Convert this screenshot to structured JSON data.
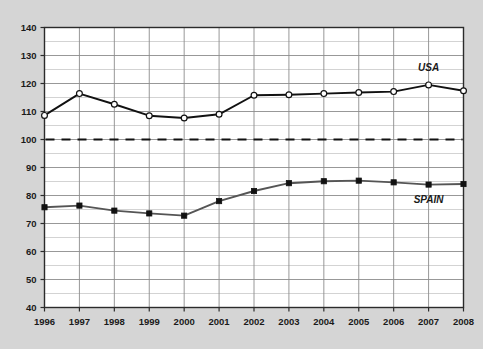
{
  "chart_data": {
    "type": "line",
    "title": "",
    "subtitle": "",
    "xlabel": "",
    "ylabel": "",
    "categories": [
      "1996",
      "1997",
      "1998",
      "1999",
      "2000",
      "2001",
      "2002",
      "2003",
      "2004",
      "2005",
      "2006",
      "2007",
      "2008"
    ],
    "x": [
      1996,
      1997,
      1998,
      1999,
      2000,
      2001,
      2002,
      2003,
      2004,
      2005,
      2006,
      2007,
      2008
    ],
    "xlim": [
      1996,
      2008
    ],
    "ylim": [
      40,
      140
    ],
    "ytick_labels": [
      "40",
      "50",
      "60",
      "70",
      "80",
      "90",
      "100",
      "110",
      "120",
      "130",
      "140"
    ],
    "yticks": [
      40,
      50,
      60,
      70,
      80,
      90,
      100,
      110,
      120,
      130,
      140
    ],
    "yminor_step": 5,
    "grid": true,
    "legend_position": "inline-right",
    "series": [
      {
        "name": "USA",
        "values": [
          108.6,
          116.4,
          112.6,
          108.5,
          107.7,
          109.0,
          115.8,
          116.0,
          116.4,
          116.8,
          117.1,
          119.5,
          117.4
        ],
        "marker": "open-circle",
        "line_color": "#111111",
        "marker_fill": "#ffffff"
      },
      {
        "name": "SPAIN",
        "values": [
          75.8,
          76.4,
          74.6,
          73.6,
          72.8,
          78.0,
          81.6,
          84.4,
          85.1,
          85.3,
          84.7,
          83.9,
          84.1
        ],
        "marker": "filled-square",
        "line_color": "#555555",
        "marker_fill": "#111111"
      }
    ],
    "reference_line": {
      "value": 100,
      "style": "dashed",
      "color": "#111111",
      "label": ""
    },
    "annotations": [
      {
        "text": "USA",
        "x": 2007,
        "y": 124.5
      },
      {
        "text": "SPAIN",
        "x": 2007,
        "y": 77.5
      }
    ],
    "colors": {
      "page_background": "#d5d5d5",
      "plot_background": "#ffffff",
      "grid_color": "#8c8c8c",
      "axis_color": "#2b2b2b",
      "text_color": "#1a1a1a"
    }
  }
}
